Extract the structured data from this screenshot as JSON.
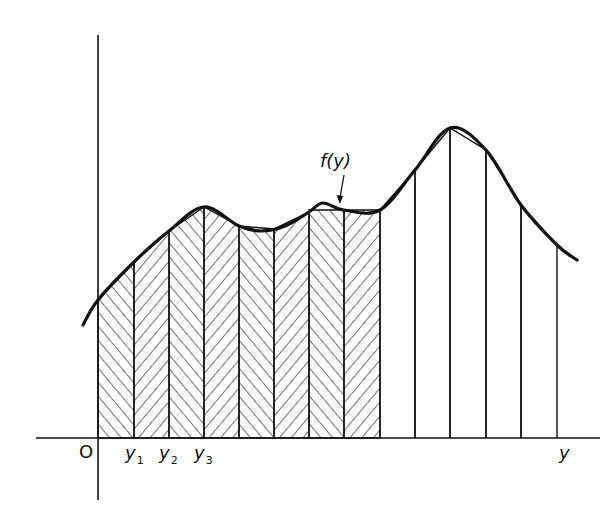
{
  "diagram": {
    "colors": {
      "ink": "#111111",
      "background": "#ffffff"
    },
    "axes": {
      "origin_label": "O",
      "horizontal_label": "y",
      "origin_px": [
        98,
        438
      ],
      "x_axis_range_px": [
        36,
        600
      ],
      "y_axis_range_px": [
        35,
        500
      ]
    },
    "curve": {
      "label": "f(y)",
      "label_pos_px": [
        320,
        150
      ],
      "arrow_from_px": [
        344,
        175
      ],
      "arrow_to_px": [
        340,
        204
      ],
      "points_px": [
        [
          83,
          325
        ],
        [
          98,
          300
        ],
        [
          134,
          262
        ],
        [
          169,
          231
        ],
        [
          204,
          207
        ],
        [
          239,
          226
        ],
        [
          262,
          231
        ],
        [
          285,
          226
        ],
        [
          309,
          212
        ],
        [
          323,
          203
        ],
        [
          344,
          210
        ],
        [
          380,
          210
        ],
        [
          415,
          170
        ],
        [
          450,
          128
        ],
        [
          486,
          150
        ],
        [
          521,
          205
        ],
        [
          557,
          245
        ],
        [
          577,
          260
        ]
      ]
    },
    "strip_boundaries_px": [
      98,
      134,
      169,
      204,
      239,
      274,
      309,
      344,
      380,
      415,
      450,
      486,
      521,
      557
    ],
    "shaded_strips": [
      {
        "x0": 98,
        "x1": 134,
        "top0": 300,
        "top1": 262,
        "hatch": "fwd"
      },
      {
        "x0": 134,
        "x1": 169,
        "top0": 262,
        "top1": 231,
        "hatch": "back"
      },
      {
        "x0": 169,
        "x1": 204,
        "top0": 231,
        "top1": 207,
        "hatch": "fwd"
      },
      {
        "x0": 204,
        "x1": 239,
        "top0": 207,
        "top1": 226,
        "hatch": "back"
      },
      {
        "x0": 239,
        "x1": 274,
        "top0": 226,
        "top1": 229,
        "hatch": "fwd"
      },
      {
        "x0": 274,
        "x1": 309,
        "top0": 229,
        "top1": 212,
        "hatch": "back"
      },
      {
        "x0": 309,
        "x1": 344,
        "top0": 210,
        "top1": 210,
        "hatch": "fwd"
      },
      {
        "x0": 344,
        "x1": 380,
        "top0": 210,
        "top1": 210,
        "hatch": "back"
      }
    ],
    "unshaded_strips": [
      {
        "x0": 380,
        "x1": 415,
        "top0": 210,
        "top1": 170
      },
      {
        "x0": 415,
        "x1": 450,
        "top0": 170,
        "top1": 128
      },
      {
        "x0": 450,
        "x1": 486,
        "top0": 128,
        "top1": 150
      },
      {
        "x0": 486,
        "x1": 521,
        "top0": 150,
        "top1": 205
      },
      {
        "x0": 521,
        "x1": 557,
        "top0": 205,
        "top1": 245
      }
    ],
    "tick_labels": [
      {
        "text": "y",
        "sub": "1",
        "x": 125,
        "y": 444
      },
      {
        "text": "y",
        "sub": "2",
        "x": 159,
        "y": 444
      },
      {
        "text": "y",
        "sub": "3",
        "x": 194,
        "y": 444
      }
    ]
  }
}
